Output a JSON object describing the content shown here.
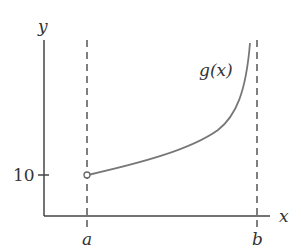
{
  "diagram": {
    "type": "function-graph",
    "axes": {
      "x_label": "x",
      "y_label": "y",
      "y_tick_label": "10"
    },
    "markers": {
      "left_bound_label": "a",
      "right_bound_label": "b"
    },
    "curve": {
      "label": "g(x)",
      "start_point": "open circle at (a, 10)",
      "behavior": "increasing, vertical asymptote at x = b"
    },
    "colors": {
      "axis": "#444444",
      "curve": "#777777",
      "dashed": "#555555",
      "text": "#333333"
    }
  }
}
